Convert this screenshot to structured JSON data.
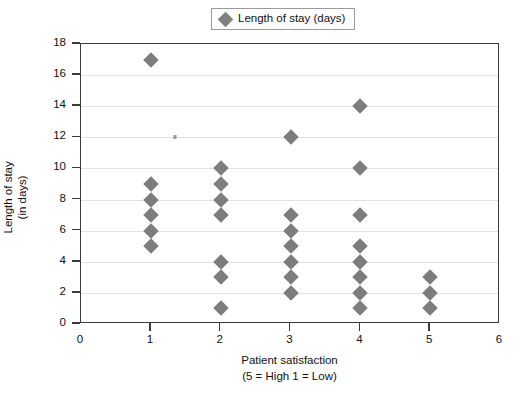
{
  "legend": {
    "entries": [
      {
        "label": "Length of stay (days)",
        "marker": "diamond-marker",
        "color": "#7d7d7d"
      }
    ]
  },
  "axes": {
    "x_title_line1": "Patient satisfaction",
    "x_title_line2": "(5 = High 1 = Low)",
    "y_title_line1": "Length of stay",
    "y_title_line2": "(in days)",
    "x_ticks": [
      "0",
      "1",
      "2",
      "3",
      "4",
      "5",
      "6"
    ],
    "y_ticks": [
      "0",
      "2",
      "4",
      "6",
      "8",
      "10",
      "12",
      "14",
      "16",
      "18"
    ]
  },
  "chart_data": {
    "type": "scatter",
    "title": "",
    "xlabel": "Patient satisfaction (5 = High 1 = Low)",
    "ylabel": "Length of stay (in days)",
    "xlim": [
      0,
      6
    ],
    "ylim": [
      0,
      18
    ],
    "xticks": [
      0,
      1,
      2,
      3,
      4,
      5,
      6
    ],
    "yticks": [
      0,
      2,
      4,
      6,
      8,
      10,
      12,
      14,
      16,
      18
    ],
    "grid": "horizontal",
    "legend_position": "top-center",
    "series": [
      {
        "name": "Length of stay (days)",
        "marker": "diamond",
        "color": "#7d7d7d",
        "points": [
          {
            "x": 1,
            "y": 17
          },
          {
            "x": 1,
            "y": 9
          },
          {
            "x": 1,
            "y": 8
          },
          {
            "x": 1,
            "y": 7
          },
          {
            "x": 1,
            "y": 6
          },
          {
            "x": 1,
            "y": 5
          },
          {
            "x": 2,
            "y": 10
          },
          {
            "x": 2,
            "y": 9
          },
          {
            "x": 2,
            "y": 8
          },
          {
            "x": 2,
            "y": 7
          },
          {
            "x": 2,
            "y": 4
          },
          {
            "x": 2,
            "y": 3
          },
          {
            "x": 2,
            "y": 1
          },
          {
            "x": 3,
            "y": 12
          },
          {
            "x": 3,
            "y": 7
          },
          {
            "x": 3,
            "y": 6
          },
          {
            "x": 3,
            "y": 5
          },
          {
            "x": 3,
            "y": 4
          },
          {
            "x": 3,
            "y": 3
          },
          {
            "x": 3,
            "y": 2
          },
          {
            "x": 4,
            "y": 14
          },
          {
            "x": 4,
            "y": 10
          },
          {
            "x": 4,
            "y": 7
          },
          {
            "x": 4,
            "y": 5
          },
          {
            "x": 4,
            "y": 4
          },
          {
            "x": 4,
            "y": 3
          },
          {
            "x": 4,
            "y": 2
          },
          {
            "x": 4,
            "y": 1
          },
          {
            "x": 5,
            "y": 3
          },
          {
            "x": 5,
            "y": 2
          },
          {
            "x": 5,
            "y": 1
          }
        ]
      }
    ],
    "artifacts": [
      {
        "x": 1.35,
        "y": 12,
        "note": "faint scan speck"
      }
    ]
  }
}
